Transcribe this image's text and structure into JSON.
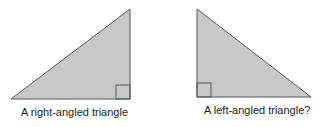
{
  "figure": {
    "colors": {
      "fill": "#c8c8c8",
      "stroke": "#555555",
      "background": "#ffffff",
      "text": "#222222"
    },
    "triangles": [
      {
        "id": "right-angled",
        "caption": "A right-angled triangle",
        "points": "11,99 130,9 130,99",
        "right_angle_marker": {
          "x": 116,
          "y": 85,
          "size": 14
        }
      },
      {
        "id": "left-angled",
        "caption": "A left-angled triangle?",
        "points": "197,9 197,97 311,97",
        "right_angle_marker": {
          "x": 197,
          "y": 83,
          "size": 14
        }
      }
    ]
  }
}
